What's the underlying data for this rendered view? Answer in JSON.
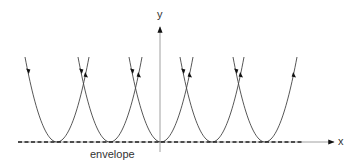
{
  "diagram": {
    "labels": {
      "y_axis": "y",
      "x_axis": "x",
      "envelope": "envelope"
    },
    "colors": {
      "curve": "#444444",
      "axis": "#888888",
      "envelope": "#222222",
      "text": "#333333"
    },
    "geometry": {
      "baseline_y": 142,
      "top_y": 57,
      "half_width": 32,
      "vertices_x": [
        57,
        110,
        161,
        212,
        265
      ],
      "y_axis_x": 160,
      "y_axis_top": 27,
      "x_axis_left": 18,
      "x_axis_right": 334
    },
    "curves": [
      {
        "name": "parabola-1",
        "vertex_x": 57,
        "left_arrow": "down",
        "right_arrow": "up"
      },
      {
        "name": "parabola-2",
        "vertex_x": 110,
        "left_arrow": "down",
        "right_arrow": "up"
      },
      {
        "name": "parabola-3",
        "vertex_x": 161,
        "left_arrow": "down",
        "right_arrow": "up"
      },
      {
        "name": "parabola-4",
        "vertex_x": 212,
        "left_arrow": "down",
        "right_arrow": "up"
      },
      {
        "name": "parabola-5",
        "vertex_x": 265,
        "left_arrow": "down",
        "right_arrow": "up"
      }
    ]
  }
}
